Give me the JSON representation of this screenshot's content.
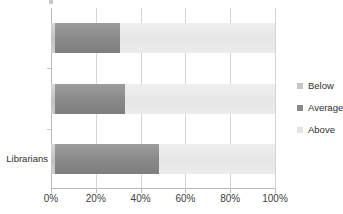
{
  "chart_data": {
    "type": "bar",
    "orientation": "horizontal",
    "stacked": true,
    "normalized_percent": true,
    "title": "",
    "subtitle": "",
    "xlabel": "",
    "ylabel": "",
    "categories": [
      "",
      "",
      "Librarians"
    ],
    "series": [
      {
        "name": "Below",
        "color": "#c2c2c2",
        "values": [
          2,
          2,
          2
        ]
      },
      {
        "name": "Average",
        "color": "#8a8a8a",
        "values": [
          29,
          31,
          46
        ]
      },
      {
        "name": "Above",
        "color": "#e6e6e6",
        "values": [
          69,
          67,
          52
        ]
      }
    ],
    "xlim": [
      0,
      100
    ],
    "xticks": [
      0,
      20,
      40,
      60,
      80,
      100
    ],
    "xtick_labels": [
      "0%",
      "20%",
      "40%",
      "60%",
      "80%",
      "100%"
    ],
    "grid": true,
    "grid_axis": "x",
    "legend_position": "right",
    "legend": [
      "Below",
      "Average",
      "Above"
    ]
  },
  "axis": {
    "x_ticks": [
      {
        "label": "0%",
        "value": 0
      },
      {
        "label": "20%",
        "value": 20
      },
      {
        "label": "40%",
        "value": 40
      },
      {
        "label": "60%",
        "value": 60
      },
      {
        "label": "80%",
        "value": 80
      },
      {
        "label": "100%",
        "value": 100
      }
    ],
    "category_labels": [
      {
        "label": "",
        "index": 0
      },
      {
        "label": "",
        "index": 1
      },
      {
        "label": "Librarians",
        "index": 2
      }
    ]
  },
  "legend": {
    "items": [
      {
        "label": "Below",
        "swatch": "legend-swatch-below",
        "color": "#c6c6c6"
      },
      {
        "label": "Average",
        "swatch": "legend-swatch-average",
        "color": "#8a8a8a"
      },
      {
        "label": "Above",
        "swatch": "legend-swatch-above",
        "color": "#e4e4e4"
      }
    ]
  }
}
